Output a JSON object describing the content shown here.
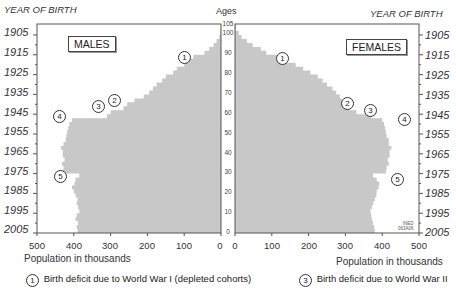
{
  "labels": {
    "year_of_birth_left": "YEAR OF BIRTH",
    "year_of_birth_right": "YEAR OF BIRTH",
    "ages": "Ages",
    "males": "MALES",
    "females": "FEMALES",
    "xlabel_left": "Population in thousands",
    "xlabel_right": "Population in thousands",
    "credit_line1": "INED",
    "credit_line2": "063A06"
  },
  "year_ticks": [
    "1905",
    "1915",
    "1925",
    "1935",
    "1945",
    "1955",
    "1965",
    "1975",
    "1985",
    "1995",
    "2005"
  ],
  "age_ticks": [
    "105",
    "100",
    "90",
    "80",
    "70",
    "60",
    "50",
    "40",
    "30",
    "20",
    "10",
    "0"
  ],
  "pop_ticks_left": [
    "500",
    "400",
    "300",
    "200",
    "100",
    "0"
  ],
  "pop_ticks_right": [
    "0",
    "100",
    "200",
    "300",
    "400",
    "500"
  ],
  "markers": {
    "m1": "1",
    "m2": "2",
    "m3": "3",
    "m4": "4",
    "m5": "5",
    "f1": "1",
    "f2": "2",
    "f3": "3",
    "f4": "4",
    "f5": "5"
  },
  "legend": [
    {
      "num": "1",
      "text": "Birth deficit due to World War I (depleted cohorts)"
    },
    {
      "num": "3",
      "text": "Birth deficit due to World War II"
    }
  ],
  "colors": {
    "bars": "#c8c8c8",
    "frame": "#555555",
    "background": "#ffffff"
  },
  "chart_data": {
    "type": "bar",
    "orientation": "horizontal",
    "title": "",
    "subtitle": "Population pyramid (Ages 0-105; birth years 1905-2005)",
    "xlabel": "Population in thousands",
    "ylabel": "Ages",
    "ylabel_secondary": "YEAR OF BIRTH",
    "xlim": [
      0,
      500
    ],
    "ylim": [
      0,
      105
    ],
    "grid": false,
    "legend_position": "bottom",
    "age_axis_ticks": [
      0,
      10,
      20,
      30,
      40,
      50,
      60,
      70,
      80,
      90,
      100,
      105
    ],
    "year_axis_ticks": [
      1905,
      1915,
      1925,
      1935,
      1945,
      1955,
      1965,
      1975,
      1985,
      1995,
      2005
    ],
    "x_ticks": [
      0,
      100,
      200,
      300,
      400,
      500
    ],
    "ages": [
      0,
      2,
      4,
      6,
      8,
      10,
      12,
      14,
      16,
      18,
      20,
      22,
      24,
      26,
      28,
      30,
      32,
      34,
      36,
      38,
      40,
      42,
      44,
      46,
      48,
      50,
      52,
      54,
      56,
      58,
      60,
      62,
      64,
      66,
      68,
      70,
      72,
      74,
      76,
      78,
      80,
      82,
      84,
      86,
      88,
      90,
      92,
      94,
      96,
      98,
      100,
      102
    ],
    "series": [
      {
        "name": "MALES",
        "values": [
          390,
          392,
          388,
          395,
          392,
          385,
          388,
          392,
          390,
          395,
          400,
          405,
          398,
          395,
          385,
          430,
          428,
          432,
          425,
          430,
          430,
          435,
          428,
          422,
          420,
          418,
          415,
          412,
          405,
          310,
          300,
          265,
          255,
          235,
          210,
          195,
          185,
          175,
          160,
          150,
          130,
          120,
          100,
          88,
          75,
          45,
          32,
          20,
          12,
          5,
          2,
          1
        ]
      },
      {
        "name": "FEMALES",
        "values": [
          380,
          378,
          375,
          372,
          370,
          368,
          372,
          376,
          380,
          384,
          385,
          390,
          392,
          385,
          375,
          410,
          412,
          418,
          415,
          420,
          420,
          425,
          418,
          418,
          412,
          410,
          408,
          405,
          400,
          370,
          330,
          310,
          300,
          290,
          285,
          275,
          265,
          250,
          238,
          225,
          205,
          185,
          165,
          140,
          115,
          85,
          70,
          48,
          32,
          18,
          10,
          3
        ]
      }
    ],
    "annotations": [
      {
        "id": 1,
        "label": "Birth deficit due to World War I (depleted cohorts)",
        "age_approx": 87
      },
      {
        "id": 2,
        "label": "",
        "age_approx": 64
      },
      {
        "id": 3,
        "label": "Birth deficit due to World War II",
        "age_approx": 61
      },
      {
        "id": 4,
        "label": "",
        "age_approx": 57
      },
      {
        "id": 5,
        "label": "",
        "age_approx": 28
      }
    ]
  }
}
